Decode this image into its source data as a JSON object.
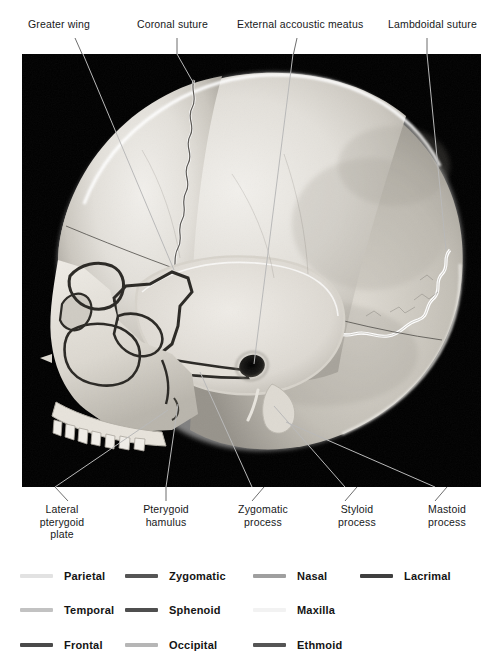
{
  "figure": {
    "kind": "anatomical-photograph",
    "background_color": "#000000",
    "frame": {
      "x": 22,
      "y": 54,
      "width": 459,
      "height": 433
    }
  },
  "top_labels": [
    {
      "id": "greater-wing",
      "text": "Greater wing",
      "x": 28,
      "y": 18,
      "leader": {
        "x1": 75,
        "y1": 38,
        "x2": 140,
        "y2": 270
      }
    },
    {
      "id": "coronal-suture",
      "text": "Coronal suture",
      "x": 137,
      "y": 18,
      "leader": {
        "x1": 177,
        "y1": 38,
        "x2": 177,
        "y2": 84
      }
    },
    {
      "id": "external-accoustic-meatus",
      "text": "External accoustic meatus",
      "x": 237,
      "y": 18,
      "leader": {
        "x1": 297,
        "y1": 38,
        "x2": 253,
        "y2": 366
      }
    },
    {
      "id": "lambdoidal-suture",
      "text": "Lambdoidal suture",
      "x": 388,
      "y": 18,
      "leader": {
        "x1": 427,
        "y1": 38,
        "x2": 427,
        "y2": 240
      }
    }
  ],
  "bottom_labels": [
    {
      "id": "lateral-pterygoid-plate",
      "lines": [
        "Lateral",
        "pterygoid",
        "plate"
      ],
      "cx": 62,
      "y": 503,
      "leader": {
        "x1": 55,
        "y1": 497,
        "x2": 168,
        "y2": 418
      }
    },
    {
      "id": "pterygoid-hamulus",
      "lines": [
        "Pterygoid",
        "hamulus"
      ],
      "cx": 166,
      "y": 503,
      "leader": {
        "x1": 166,
        "y1": 497,
        "x2": 192,
        "y2": 400
      }
    },
    {
      "id": "zygomatic-process",
      "lines": [
        "Zygomatic",
        "process"
      ],
      "cx": 263,
      "y": 503,
      "leader": {
        "x1": 252,
        "y1": 497,
        "x2": 210,
        "y2": 372
      }
    },
    {
      "id": "styloid-process",
      "lines": [
        "Styloid",
        "process"
      ],
      "cx": 357,
      "y": 503,
      "leader": {
        "x1": 345,
        "y1": 497,
        "x2": 282,
        "y2": 404
      }
    },
    {
      "id": "mastoid-process",
      "lines": [
        "Mastoid",
        "process"
      ],
      "cx": 447,
      "y": 503,
      "leader": {
        "x1": 435,
        "y1": 497,
        "x2": 292,
        "y2": 420
      }
    }
  ],
  "legend": {
    "columns_x": [
      20,
      125,
      253,
      360
    ],
    "rows_y": [
      570,
      604,
      639
    ],
    "items": [
      {
        "id": "parietal",
        "label": "Parietal",
        "color": "#e2e2e2",
        "col": 0,
        "row": 0
      },
      {
        "id": "temporal",
        "label": "Temporal",
        "color": "#c2c2c2",
        "col": 0,
        "row": 1
      },
      {
        "id": "frontal",
        "label": "Frontal",
        "color": "#4a4a4a",
        "col": 0,
        "row": 2
      },
      {
        "id": "zygomatic",
        "label": "Zygomatic",
        "color": "#555555",
        "col": 1,
        "row": 0
      },
      {
        "id": "sphenoid",
        "label": "Sphenoid",
        "color": "#4f4f4f",
        "col": 1,
        "row": 1
      },
      {
        "id": "occipital",
        "label": "Occipital",
        "color": "#b6b6b6",
        "col": 1,
        "row": 2
      },
      {
        "id": "nasal",
        "label": "Nasal",
        "color": "#9f9f9f",
        "col": 2,
        "row": 0
      },
      {
        "id": "maxilla",
        "label": "Maxilla",
        "color": "#f2f2f2",
        "col": 2,
        "row": 1
      },
      {
        "id": "lacrimal",
        "label": "Lacrimal",
        "color": "#3f3f3f",
        "col": 3,
        "row": 0
      }
    ]
  },
  "caption": ""
}
